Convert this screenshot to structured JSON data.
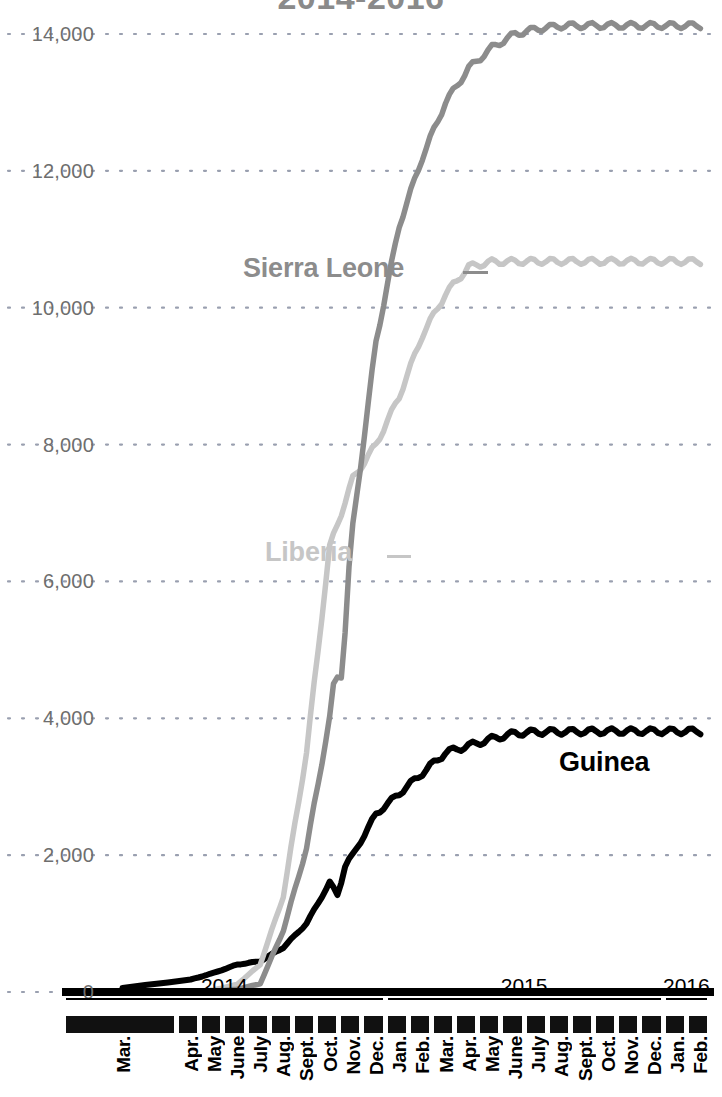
{
  "chart_data": {
    "type": "line",
    "title": "2014-2016",
    "xlabel": "",
    "ylabel": "",
    "ylim": [
      0,
      14600
    ],
    "yticks": [
      0,
      2000,
      4000,
      6000,
      8000,
      10000,
      12000,
      14000
    ],
    "ytick_labels": [
      "0",
      "2,000",
      "4,000",
      "6,000",
      "8,000",
      "10,000",
      "12,000",
      "14,000"
    ],
    "grid": "dotted-horizontal",
    "legend_position": "inline-annotations",
    "x": [
      "Mar. 2014",
      "Apr. 2014",
      "May 2014",
      "June 2014",
      "July 2014",
      "Aug. 2014",
      "Sept. 2014",
      "Oct. 2014",
      "Nov. 2014",
      "Dec. 2014",
      "Jan. 2015",
      "Feb. 2015",
      "Mar. 2015",
      "Apr. 2015",
      "May 2015",
      "June 2015",
      "July 2015",
      "Aug. 2015",
      "Sept. 2015",
      "Oct. 2015",
      "Nov. 2015",
      "Dec. 2015",
      "Jan. 2016",
      "Feb. 2016"
    ],
    "xtick_labels": [
      "Mar.",
      "Apr.",
      "May",
      "June",
      "July",
      "Aug.",
      "Sept.",
      "Oct.",
      "Nov.",
      "Dec.",
      "Jan.",
      "Feb.",
      "Mar.",
      "Apr.",
      "May",
      "June",
      "July",
      "Aug.",
      "Sept.",
      "Oct.",
      "Nov.",
      "Dec.",
      "Jan.",
      "Feb."
    ],
    "year_markers": [
      {
        "label": "2014",
        "start_index": 0,
        "end_index": 9
      },
      {
        "label": "2015",
        "start_index": 10,
        "end_index": 21
      },
      {
        "label": "2016",
        "start_index": 22,
        "end_index": 23
      }
    ],
    "series": [
      {
        "name": "Sierra Leone",
        "color": "#8c8c8c",
        "final_value": 14124,
        "values": [
          0,
          0,
          10,
          40,
          120,
          900,
          2100,
          4000,
          6800,
          9500,
          11200,
          12200,
          13000,
          13500,
          13800,
          14000,
          14080,
          14120,
          14124,
          14124,
          14124,
          14124,
          14124,
          14124
        ]
      },
      {
        "name": "Liberia",
        "color": "#c6c6c6",
        "final_value": 10678,
        "values": [
          0,
          0,
          30,
          110,
          400,
          1400,
          3500,
          6500,
          7500,
          8000,
          8700,
          9600,
          10200,
          10600,
          10670,
          10675,
          10678,
          10678,
          10678,
          10678,
          10678,
          10678,
          10678,
          10678
        ]
      },
      {
        "name": "Guinea",
        "color": "#000000",
        "final_value": 3811,
        "values": [
          60,
          180,
          280,
          400,
          450,
          650,
          1000,
          1600,
          2000,
          2600,
          2900,
          3200,
          3500,
          3600,
          3700,
          3780,
          3800,
          3804,
          3808,
          3810,
          3811,
          3811,
          3811,
          3811
        ]
      }
    ]
  },
  "annotations": [
    {
      "name": "Sierra Leone",
      "label": "Sierra Leone"
    },
    {
      "name": "Liberia",
      "label": "Liberia"
    },
    {
      "name": "Guinea",
      "label": "Guinea"
    }
  ]
}
